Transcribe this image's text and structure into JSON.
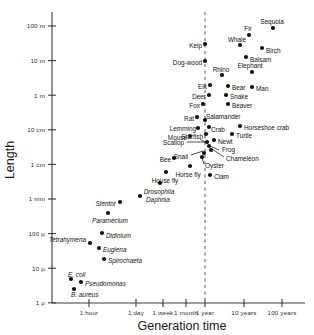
{
  "chart_data": {
    "type": "scatter",
    "title": "",
    "xlabel": "Generation time",
    "ylabel": "Length",
    "xscale": "log",
    "yscale": "log",
    "grid": false,
    "legend": null,
    "xticklabels": [
      "1 hour",
      "1 day",
      "1 week",
      "1 month",
      "1 year",
      "10 years",
      "100 years"
    ],
    "yticklabels": [
      "100 m",
      "10 m",
      "1 m",
      "10 cm",
      "1 cm",
      "1 mm",
      "100 µ",
      "10 µ",
      "1 µ"
    ],
    "annotations": [
      {
        "text": "1 year reference line",
        "type": "vertical-dashed-line",
        "x": "1 year"
      }
    ],
    "points": [
      {
        "label": "Sequoia",
        "x": "30 years",
        "y": "100 m",
        "px": 273,
        "py": 28,
        "lx": 272,
        "ly": 22,
        "anchor": "middle",
        "italic": false
      },
      {
        "label": "Fir",
        "x": "12 years",
        "y": "55 m",
        "px": 249,
        "py": 35,
        "lx": 248,
        "ly": 29,
        "anchor": "middle",
        "italic": false
      },
      {
        "label": "Whale",
        "x": "7 years",
        "y": "22 m",
        "px": 240,
        "py": 45,
        "lx": 237,
        "ly": 40,
        "anchor": "middle",
        "italic": false
      },
      {
        "label": "Birch",
        "x": "22 years",
        "y": "18 m",
        "px": 262,
        "py": 48,
        "lx": 266,
        "ly": 51,
        "anchor": "start",
        "italic": false
      },
      {
        "label": "Balsam",
        "x": "16 years",
        "y": "12 m",
        "px": 246,
        "py": 57,
        "lx": 250,
        "ly": 60,
        "anchor": "start",
        "italic": false
      },
      {
        "label": "Kelp",
        "x": "1 year",
        "y": "13 m",
        "px": 205,
        "py": 44,
        "lx": 202,
        "ly": 46,
        "anchor": "end",
        "italic": false
      },
      {
        "label": "Dog-wood",
        "x": "1 year",
        "y": "7 m",
        "px": 205,
        "py": 61,
        "lx": 202,
        "ly": 63,
        "anchor": "end",
        "italic": false
      },
      {
        "label": "Rhino",
        "x": "2 years",
        "y": "3.5 m",
        "px": 222,
        "py": 75,
        "lx": 221,
        "ly": 70,
        "anchor": "middle",
        "italic": false
      },
      {
        "label": "Elephant",
        "x": "10 years",
        "y": "4 m",
        "px": 252,
        "py": 72,
        "lx": 250,
        "ly": 66,
        "anchor": "middle",
        "italic": false
      },
      {
        "label": "Elk",
        "x": "1.2 years",
        "y": "2.5 m",
        "px": 210,
        "py": 85,
        "lx": 207,
        "ly": 87,
        "anchor": "end",
        "italic": false
      },
      {
        "label": "Bear",
        "x": "3 years",
        "y": "2 m",
        "px": 228,
        "py": 86,
        "lx": 232,
        "ly": 88,
        "anchor": "start",
        "italic": false
      },
      {
        "label": "Man",
        "x": "12 years",
        "y": "1.8 m",
        "px": 252,
        "py": 87,
        "lx": 256,
        "ly": 89,
        "anchor": "start",
        "italic": false
      },
      {
        "label": "Deer",
        "x": "1.1 years",
        "y": "1.5 m",
        "px": 209,
        "py": 95,
        "lx": 206,
        "ly": 97,
        "anchor": "end",
        "italic": false
      },
      {
        "label": "Snake",
        "x": "2.2 years",
        "y": "1.3 m",
        "px": 226,
        "py": 95,
        "lx": 230,
        "ly": 97,
        "anchor": "start",
        "italic": false
      },
      {
        "label": "Beaver",
        "x": "3 years",
        "y": "0.9 m",
        "px": 228,
        "py": 104,
        "lx": 232,
        "ly": 106,
        "anchor": "start",
        "italic": false
      },
      {
        "label": "Fox",
        "x": "1 year",
        "y": "0.7 m",
        "px": 203,
        "py": 104,
        "lx": 200,
        "ly": 106,
        "anchor": "end",
        "italic": false
      },
      {
        "label": "Rat",
        "x": "7 months",
        "y": "0.3 m",
        "px": 197,
        "py": 117,
        "lx": 194,
        "ly": 119,
        "anchor": "end",
        "italic": false
      },
      {
        "label": "Salamander",
        "x": "1.5 years",
        "y": "0.28 m",
        "px": 205,
        "py": 120,
        "lx": 206,
        "ly": 117,
        "anchor": "start",
        "italic": false
      },
      {
        "label": "Crab",
        "x": "1.6 years",
        "y": "0.2 m",
        "px": 209,
        "py": 127,
        "lx": 211,
        "ly": 130,
        "anchor": "start",
        "italic": false
      },
      {
        "label": "Horseshoe crab",
        "x": "6 years",
        "y": "0.22 m",
        "px": 240,
        "py": 126,
        "lx": 244,
        "ly": 128,
        "anchor": "start",
        "italic": false
      },
      {
        "label": "Lemming",
        "x": "5 months",
        "y": "0.17 m",
        "px": 198,
        "py": 128,
        "lx": 196,
        "ly": 129,
        "anchor": "end",
        "italic": false
      },
      {
        "label": "Mouse",
        "x": "4 months",
        "y": "0.13 m",
        "px": 190,
        "py": 136,
        "lx": 187,
        "ly": 138,
        "anchor": "end",
        "italic": false
      },
      {
        "label": "Starfish",
        "x": "1 year",
        "y": "0.13 m",
        "px": 206,
        "py": 134,
        "lx": 203,
        "ly": 137,
        "anchor": "end",
        "italic": false
      },
      {
        "label": "Turtle",
        "x": "4 years",
        "y": "0.15 m",
        "px": 232,
        "py": 134,
        "lx": 236,
        "ly": 136,
        "anchor": "start",
        "italic": false
      },
      {
        "label": "Newt",
        "x": "1.4 years",
        "y": "0.1 m",
        "px": 214,
        "py": 140,
        "lx": 218,
        "ly": 142,
        "anchor": "start",
        "italic": false
      },
      {
        "label": "Scallop",
        "x": "1.1 years",
        "y": "0.09 m",
        "px": 207,
        "py": 142,
        "lx": 184,
        "ly": 143,
        "anchor": "end",
        "italic": false
      },
      {
        "label": "Frog",
        "x": "1.5 years",
        "y": "0.07 m",
        "px": 209,
        "py": 146,
        "lx": 222,
        "ly": 150,
        "anchor": "start",
        "italic": false
      },
      {
        "label": "Chameleon",
        "x": "1.7 years",
        "y": "0.05 m",
        "px": 211,
        "py": 150,
        "lx": 226,
        "ly": 159,
        "anchor": "start",
        "italic": false
      },
      {
        "label": "Snail",
        "x": "1 year",
        "y": "0.04 m",
        "px": 204,
        "py": 153,
        "lx": 188,
        "ly": 157,
        "anchor": "end",
        "italic": false
      },
      {
        "label": "Oyster",
        "x": "1 year",
        "y": "0.03 m",
        "px": 202,
        "py": 157,
        "lx": 205,
        "ly": 166,
        "anchor": "start",
        "italic": false
      },
      {
        "label": "Bee",
        "x": "2 months",
        "y": "0.015 m",
        "px": 174,
        "py": 158,
        "lx": 171,
        "ly": 160,
        "anchor": "end",
        "italic": false
      },
      {
        "label": "Clam",
        "x": "3 years",
        "y": "0.02 m",
        "px": 210,
        "py": 175,
        "lx": 214,
        "ly": 177,
        "anchor": "start",
        "italic": false
      },
      {
        "label": "Horse fly",
        "x": "5 weeks",
        "y": "0.012 m",
        "px": 190,
        "py": 166,
        "lx": 188,
        "ly": 175,
        "anchor": "middle",
        "italic": false
      },
      {
        "label": "House fly",
        "x": "3 weeks",
        "y": "0.008 m",
        "px": 166,
        "py": 172,
        "lx": 165,
        "ly": 181,
        "anchor": "middle",
        "italic": false
      },
      {
        "label": "Drosophila",
        "x": "2 weeks",
        "y": "0.003 m",
        "px": 160,
        "py": 183,
        "lx": 159,
        "ly": 192,
        "anchor": "middle",
        "italic": true
      },
      {
        "label": "Daphnia",
        "x": "10 days",
        "y": "0.0015 m",
        "px": 140,
        "py": 196,
        "lx": 146,
        "ly": 200,
        "anchor": "start",
        "italic": true
      },
      {
        "label": "Stentor",
        "x": "3 days",
        "y": "0.001 m",
        "px": 120,
        "py": 202,
        "lx": 116,
        "ly": 204,
        "anchor": "end",
        "italic": true
      },
      {
        "label": "Paramecium",
        "x": "1.5 days",
        "y": "0.0003 m",
        "px": 108,
        "py": 213,
        "lx": 110,
        "ly": 221,
        "anchor": "middle",
        "italic": true
      },
      {
        "label": "Didinium",
        "x": "1.5 days",
        "y": "0.00012 m",
        "px": 102,
        "py": 233,
        "lx": 106,
        "ly": 236,
        "anchor": "start",
        "italic": true
      },
      {
        "label": "Tetrahymena",
        "x": "10 hours",
        "y": "0.00007 m",
        "px": 90,
        "py": 243,
        "lx": 86,
        "ly": 240,
        "anchor": "end",
        "italic": true
      },
      {
        "label": "Euglena",
        "x": "1.5 days",
        "y": "0.00005 m",
        "px": 99,
        "py": 248,
        "lx": 103,
        "ly": 250,
        "anchor": "start",
        "italic": true
      },
      {
        "label": "Spirochaeta",
        "x": "2 days",
        "y": "0.00003 m",
        "px": 104,
        "py": 259,
        "lx": 108,
        "ly": 261,
        "anchor": "start",
        "italic": true
      },
      {
        "label": "E. coli",
        "x": "40 min",
        "y": "3 µ",
        "px": 71,
        "py": 279,
        "lx": 68,
        "ly": 275,
        "anchor": "start",
        "italic": true
      },
      {
        "label": "Pseudomonas",
        "x": "1 hour",
        "y": "2.5 µ",
        "px": 81,
        "py": 282,
        "lx": 85,
        "ly": 284,
        "anchor": "start",
        "italic": true
      },
      {
        "label": "B. aureus",
        "x": "50 min",
        "y": "1.6 µ",
        "px": 74,
        "py": 289,
        "lx": 71,
        "ly": 295,
        "anchor": "start",
        "italic": true
      }
    ],
    "leaders": [
      {
        "from": [
          187,
          142
        ],
        "to": [
          205,
          142
        ]
      },
      {
        "from": [
          205,
          142
        ],
        "to": [
          200,
          139
        ]
      },
      {
        "from": [
          191,
          155
        ],
        "to": [
          203,
          151
        ]
      },
      {
        "from": [
          219,
          150
        ],
        "to": [
          210,
          146
        ]
      },
      {
        "from": [
          224,
          157
        ],
        "to": [
          212,
          149
        ]
      },
      {
        "from": [
          204,
          164
        ],
        "to": [
          202,
          158
        ]
      }
    ]
  }
}
